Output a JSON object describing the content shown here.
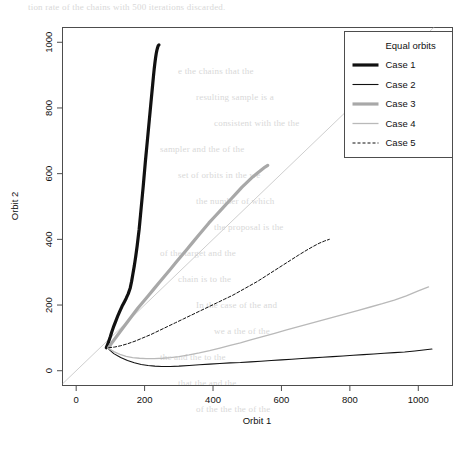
{
  "chart_data": {
    "type": "line",
    "title": "",
    "xlabel": "Orbit 1",
    "ylabel": "Orbit 2",
    "xlim": [
      -40,
      1100
    ],
    "ylim": [
      -45,
      1045
    ],
    "xticks": [
      0,
      200,
      400,
      600,
      800,
      1000
    ],
    "yticks": [
      0,
      200,
      400,
      600,
      800,
      1000
    ],
    "xticklabels": [
      "0",
      "200",
      "400",
      "600",
      "800",
      "1000"
    ],
    "yticklabels": [
      "0",
      "200",
      "400",
      "600",
      "800",
      "1000"
    ],
    "grid": false,
    "legend_position": "top-right",
    "legend_title": "",
    "reference_line": {
      "name": "Equal orbits",
      "kind": "identity",
      "x": [
        -40,
        1100
      ],
      "y": [
        -40,
        1100
      ],
      "color": "#c8c8c8",
      "width": 0.9,
      "dash": ""
    },
    "series": [
      {
        "name": "Case 1",
        "color": "#111111",
        "width": 3.2,
        "dash": "",
        "x": [
          88,
          92,
          96,
          100,
          104,
          110,
          116,
          122,
          128,
          134,
          140,
          146,
          152,
          158,
          162,
          166,
          170,
          174,
          178,
          181,
          184,
          186,
          188,
          190,
          192,
          194,
          196,
          198,
          200,
          202,
          204,
          206,
          208,
          210,
          212,
          214,
          216,
          218,
          220,
          222,
          224,
          226,
          228,
          230,
          232,
          234,
          236,
          238,
          240,
          242
        ],
        "y": [
          70,
          80,
          92,
          104,
          118,
          136,
          152,
          168,
          182,
          196,
          208,
          220,
          234,
          252,
          272,
          296,
          320,
          348,
          378,
          404,
          430,
          452,
          474,
          496,
          518,
          540,
          562,
          586,
          610,
          634,
          656,
          678,
          700,
          722,
          744,
          766,
          788,
          810,
          832,
          854,
          876,
          898,
          918,
          936,
          952,
          966,
          976,
          984,
          990,
          992
        ]
      },
      {
        "name": "Case 2",
        "color": "#111111",
        "width": 1.1,
        "dash": "",
        "x": [
          95,
          110,
          130,
          150,
          170,
          190,
          210,
          230,
          250,
          275,
          300,
          330,
          360,
          390,
          420,
          450,
          480,
          510,
          540,
          570,
          600,
          630,
          660,
          690,
          720,
          750,
          780,
          810,
          840,
          870,
          900,
          930,
          960,
          990,
          1015,
          1040
        ],
        "y": [
          66,
          52,
          40,
          31,
          24,
          19,
          16,
          14,
          13,
          13,
          14,
          16,
          18,
          20,
          22,
          24,
          25,
          27,
          29,
          31,
          33,
          35,
          37,
          39,
          41,
          43,
          45,
          47,
          49,
          51,
          53,
          55,
          57,
          60,
          63,
          66
        ]
      },
      {
        "name": "Case 3",
        "color": "#a8a8a8",
        "width": 3.2,
        "dash": "",
        "x": [
          95,
          105,
          118,
          132,
          148,
          164,
          180,
          196,
          212,
          228,
          244,
          260,
          276,
          292,
          308,
          324,
          340,
          356,
          372,
          388,
          404,
          420,
          436,
          452,
          468,
          484,
          500,
          516,
          530,
          542,
          552,
          560
        ],
        "y": [
          70,
          86,
          104,
          124,
          146,
          168,
          190,
          210,
          230,
          250,
          270,
          290,
          310,
          330,
          350,
          370,
          390,
          410,
          430,
          450,
          468,
          486,
          504,
          522,
          540,
          558,
          574,
          590,
          602,
          612,
          620,
          625
        ]
      },
      {
        "name": "Case 4",
        "color": "#b9b9b9",
        "width": 1.3,
        "dash": "",
        "x": [
          95,
          110,
          128,
          146,
          165,
          185,
          205,
          228,
          252,
          276,
          300,
          330,
          360,
          390,
          420,
          450,
          480,
          510,
          545,
          580,
          615,
          650,
          685,
          720,
          755,
          790,
          825,
          860,
          895,
          930,
          965,
          1000,
          1030
        ],
        "y": [
          68,
          58,
          50,
          44,
          40,
          38,
          37,
          37,
          38,
          40,
          43,
          48,
          54,
          61,
          69,
          77,
          85,
          94,
          104,
          114,
          124,
          134,
          144,
          154,
          164,
          174,
          184,
          194,
          204,
          215,
          228,
          243,
          255
        ]
      },
      {
        "name": "Case 5",
        "color": "#111111",
        "width": 1.0,
        "dash": "3,2",
        "x": [
          95,
          112,
          130,
          150,
          172,
          195,
          218,
          242,
          266,
          290,
          314,
          338,
          362,
          386,
          410,
          434,
          458,
          482,
          506,
          530,
          554,
          578,
          602,
          626,
          650,
          672,
          692,
          710,
          726,
          740
        ],
        "y": [
          70,
          72,
          76,
          82,
          90,
          100,
          110,
          122,
          134,
          146,
          158,
          170,
          182,
          194,
          206,
          218,
          230,
          244,
          258,
          272,
          288,
          304,
          320,
          336,
          352,
          366,
          378,
          388,
          395,
          400
        ]
      }
    ],
    "legend_entries": [
      {
        "label": "Equal orbits",
        "swatch": "none"
      },
      {
        "label": "Case 1",
        "swatch": "line"
      },
      {
        "label": "Case 2",
        "swatch": "line"
      },
      {
        "label": "Case 3",
        "swatch": "line"
      },
      {
        "label": "Case 4",
        "swatch": "line"
      },
      {
        "label": "Case 5",
        "swatch": "line"
      }
    ]
  },
  "background_text": {
    "lines": [
      "tion rate of the chains with 500 iterations discarded.",
      "e the chains  that the",
      "resulting sample is a",
      "consistent with the the",
      "sampler and the of the",
      "set of orbits in the we",
      "the number of which",
      "the proposal is the",
      "of the target and the",
      "chain is to the",
      "In the case of the and",
      "we a the of the",
      "the and the to the",
      "that the and the",
      "of the the the of the"
    ]
  }
}
